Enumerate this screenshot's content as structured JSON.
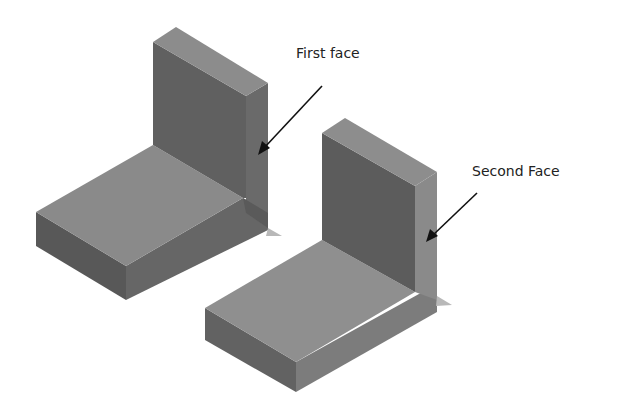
{
  "figure": {
    "labels": {
      "first": "First face",
      "second": "Second Face"
    },
    "colors": {
      "top_face": "#8f8f8f",
      "front_dark": "#5e5e5e",
      "side_face": "#7a7a7a",
      "base_top": "#8a8a8a",
      "plate_dark": "#626262",
      "arrow": "#111111"
    }
  }
}
